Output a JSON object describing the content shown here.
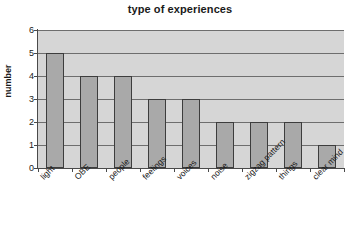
{
  "chart_data": {
    "type": "bar",
    "title": "type of experiences",
    "xlabel": "",
    "ylabel": "number",
    "categories": [
      "light",
      "OBE",
      "people",
      "feelings",
      "voices",
      "noise",
      "zigzag pattern",
      "things",
      "clear mind"
    ],
    "values": [
      5,
      4,
      4,
      3,
      3,
      2,
      2,
      2,
      1
    ],
    "ylim": [
      0,
      6
    ],
    "yticks": [
      0,
      1,
      2,
      3,
      4,
      5,
      6
    ],
    "ytick_labels": [
      "0",
      "1",
      "2",
      "3",
      "4",
      "5",
      "6"
    ],
    "grid": true,
    "legend": false,
    "colors": {
      "bar_fill": "#a9a9a9",
      "bar_border": "#3d3d3d",
      "plot_background": "#d6d6d6",
      "gridline": "#6e6e6e",
      "axis": "#4a4a4a",
      "text": "#1a1a1a",
      "page_background": "#ffffff"
    }
  }
}
